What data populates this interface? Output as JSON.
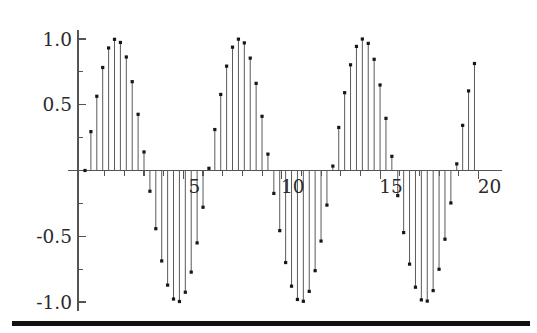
{
  "figure": {
    "title": "",
    "background_color": "#ffffff",
    "rule_color": "#111111"
  },
  "axes": {
    "y_tick_labels": [
      "1.0",
      "0.5",
      "-0.5",
      "-1.0"
    ],
    "x_tick_labels": [
      "5",
      "10",
      "15",
      "20"
    ],
    "axis_color": "#545454",
    "stem_color": "#5a5a5a",
    "marker_color": "#161616"
  },
  "chart_data": {
    "type": "line",
    "plot_style": "stem",
    "title": "",
    "xlabel": "",
    "ylabel": "",
    "xlim": [
      0,
      20.6
    ],
    "ylim": [
      -1.05,
      1.05
    ],
    "grid": false,
    "legend": null,
    "x_ticks": [
      5,
      10,
      15,
      20
    ],
    "y_ticks": [
      1.0,
      0.5,
      -0.5,
      -1.0
    ],
    "y_minor_ticks": [
      0.75,
      0.25,
      -0.25,
      -0.75
    ],
    "x_minor_ticks": [
      1,
      2,
      3,
      4,
      6,
      7,
      8,
      9,
      11,
      12,
      13,
      14,
      16,
      17,
      18,
      19
    ],
    "expression": "sin(x)",
    "sample_step": 0.3,
    "series": [
      {
        "name": "sin(x)",
        "x": [
          0,
          0.3,
          0.6,
          0.9,
          1.2,
          1.5,
          1.8,
          2.1,
          2.4,
          2.7,
          3.0,
          3.3,
          3.6,
          3.9,
          4.2,
          4.5,
          4.8,
          5.1,
          5.4,
          5.7,
          6.0,
          6.3,
          6.6,
          6.9,
          7.2,
          7.5,
          7.8,
          8.1,
          8.4,
          8.7,
          9.0,
          9.3,
          9.6,
          9.9,
          10.2,
          10.5,
          10.8,
          11.1,
          11.4,
          11.7,
          12.0,
          12.3,
          12.6,
          12.9,
          13.2,
          13.5,
          13.8,
          14.1,
          14.4,
          14.7,
          15.0,
          15.3,
          15.6,
          15.9,
          16.2,
          16.5,
          16.8,
          17.1,
          17.4,
          17.7,
          18.0,
          18.3,
          18.6,
          18.9,
          19.2,
          19.5,
          19.8
        ],
        "values": [
          0.0,
          0.2955,
          0.5646,
          0.7833,
          0.932,
          0.9975,
          0.9738,
          0.8632,
          0.6755,
          0.4274,
          0.1411,
          -0.1577,
          -0.4425,
          -0.6878,
          -0.8716,
          -0.9775,
          -0.9962,
          -0.9258,
          -0.7728,
          -0.5507,
          -0.2794,
          0.0168,
          0.3115,
          0.5784,
          0.7937,
          0.938,
          0.9989,
          0.9705,
          0.8546,
          0.6627,
          0.4121,
          0.1245,
          -0.1743,
          -0.4575,
          -0.7,
          -0.8797,
          -0.9809,
          -0.9946,
          -0.9193,
          -0.7619,
          -0.5366,
          -0.2632,
          0.0336,
          0.3275,
          0.5919,
          0.8038,
          0.9436,
          0.9999,
          0.9668,
          0.8457,
          0.6503,
          0.3967,
          0.1079,
          -0.1908,
          -0.4723,
          -0.712,
          -0.8876,
          -0.9839,
          -0.9929,
          -0.9133,
          -0.751,
          -0.5224,
          -0.2469,
          0.0504,
          0.3433,
          0.6052,
          0.8137
        ]
      }
    ]
  }
}
